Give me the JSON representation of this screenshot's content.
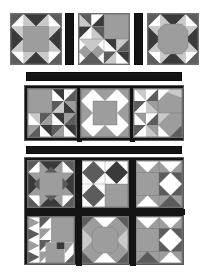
{
  "figure": {
    "type": "quilt-layout",
    "canvas": {
      "width": 208,
      "height": 277,
      "background": "#ffffff"
    },
    "palette": {
      "white": "#ffffff",
      "light_gray": "#c9c9c9",
      "medium_gray": "#9d9d9d",
      "dark_gray": "#5c5c5c",
      "darkest": "#3a3a3a",
      "black": "#141414",
      "outline": "#6f6f6f"
    }
  },
  "sections": [
    {
      "name": "top-row",
      "label": "Top row of sample blocks",
      "x": 10,
      "y": 13,
      "width": 190,
      "height": 54,
      "blocks": [
        {
          "name": "block-sawtooth-star",
          "label": "Sawtooth Star",
          "x": 0,
          "y": 0,
          "size": 52,
          "pattern": "sawtooth-star"
        },
        {
          "name": "block-pinwheel-corner",
          "label": "Pinwheel Corner",
          "x": 68,
          "y": 0,
          "size": 52,
          "pattern": "pinwheel-corner"
        },
        {
          "name": "block-snowball-star",
          "label": "Snowball Star",
          "x": 137,
          "y": 0,
          "size": 52,
          "pattern": "snowball-star"
        }
      ],
      "sashes": [
        {
          "name": "vertical-sash-1",
          "x": 55,
          "y": 0,
          "width": 9,
          "height": 52
        },
        {
          "name": "vertical-sash-2",
          "x": 124,
          "y": 0,
          "width": 9,
          "height": 52
        }
      ]
    },
    {
      "name": "divider-bar-1",
      "label": "Horizontal sashing bar one",
      "x": 26,
      "y": 72,
      "width": 156,
      "height": 9
    },
    {
      "name": "middle-row",
      "label": "Middle row panel of three blocks",
      "x": 24,
      "y": 85,
      "width": 160,
      "height": 56,
      "blocks": [
        {
          "name": "block-broken-dishes",
          "label": "Broken Dishes",
          "x": 2,
          "y": 2,
          "size": 50,
          "pattern": "broken-dishes"
        },
        {
          "name": "block-sawtooth-star-2",
          "label": "Sawtooth Star",
          "x": 55,
          "y": 2,
          "size": 50,
          "pattern": "sawtooth-star"
        },
        {
          "name": "block-flying-geese",
          "label": "Flying Geese Corner",
          "x": 108,
          "y": 2,
          "size": 50,
          "pattern": "flying-geese"
        }
      ],
      "sashes": [
        {
          "name": "middle-vertical-sash-1",
          "x": 52,
          "y": 0,
          "width": 5,
          "height": 56
        },
        {
          "name": "middle-vertical-sash-2",
          "x": 105,
          "y": 0,
          "width": 5,
          "height": 56
        }
      ]
    },
    {
      "name": "divider-bar-2",
      "label": "Horizontal sashing bar two",
      "x": 26,
      "y": 146,
      "width": 156,
      "height": 8
    },
    {
      "name": "bottom-grid",
      "label": "Bottom two by three block grid",
      "x": 24,
      "y": 157,
      "width": 160,
      "height": 108,
      "blocks": [
        {
          "name": "block-diamond-square",
          "label": "Diamond in a Square",
          "x": 2,
          "y": 2,
          "size": 48,
          "pattern": "diamond-square"
        },
        {
          "name": "block-hourglass-corner",
          "label": "Hourglass Corner",
          "x": 56,
          "y": 2,
          "size": 48,
          "pattern": "hourglass-corner"
        },
        {
          "name": "block-kaleidoscope",
          "label": "Kaleidoscope",
          "x": 110,
          "y": 2,
          "size": 48,
          "pattern": "kaleidoscope"
        },
        {
          "name": "block-zigzag",
          "label": "Zig Zag Corner",
          "x": 2,
          "y": 58,
          "size": 48,
          "pattern": "zigzag"
        },
        {
          "name": "block-snowball-star-2",
          "label": "Snowball Star",
          "x": 56,
          "y": 58,
          "size": 48,
          "pattern": "snowball-star"
        },
        {
          "name": "block-double-pinwheel",
          "label": "Double Pinwheel",
          "x": 110,
          "y": 58,
          "size": 48,
          "pattern": "double-pinwheel"
        }
      ],
      "sashes": [
        {
          "name": "bottom-vertical-sash-1",
          "x": 51,
          "y": 0,
          "width": 6,
          "height": 108
        },
        {
          "name": "bottom-vertical-sash-2",
          "x": 105,
          "y": 0,
          "width": 6,
          "height": 108
        },
        {
          "name": "bottom-horizontal-sash-1",
          "x": 0,
          "y": 51,
          "width": 160,
          "height": 6
        }
      ]
    }
  ]
}
